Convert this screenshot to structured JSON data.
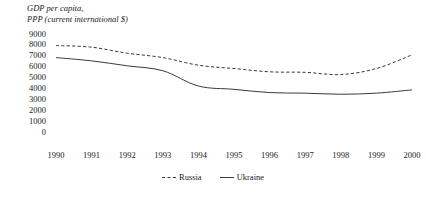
{
  "chart_data": {
    "type": "line",
    "title": "GDP per capita,\nPPP (current international $)",
    "xlabel": "",
    "ylabel": "",
    "ylim": [
      0,
      9000
    ],
    "ytick_step": 1000,
    "yticks": [
      "9000",
      "8000",
      "7000",
      "6000",
      "5000",
      "4000",
      "3000",
      "2000",
      "1000",
      "0"
    ],
    "categories": [
      "1990",
      "1991",
      "1992",
      "1993",
      "1994",
      "1995",
      "1996",
      "1997",
      "1998",
      "1999",
      "2000"
    ],
    "x": [
      1990,
      1991,
      1992,
      1993,
      1994,
      1995,
      1996,
      1997,
      1998,
      1999,
      2000
    ],
    "grid": false,
    "legend_position": "bottom",
    "series": [
      {
        "name": "Russia",
        "style": "dashed",
        "color": "#3a3a3a",
        "values": [
          7900,
          7750,
          7200,
          6800,
          6100,
          5800,
          5500,
          5450,
          5250,
          5800,
          7050
        ]
      },
      {
        "name": "Ukraine",
        "style": "solid",
        "color": "#3a3a3a",
        "values": [
          6800,
          6500,
          6050,
          5600,
          4200,
          3900,
          3600,
          3550,
          3450,
          3550,
          3850
        ]
      }
    ]
  },
  "legend": {
    "items": [
      {
        "label": "Russia",
        "style": "dashed"
      },
      {
        "label": "Ukraine",
        "style": "solid"
      }
    ]
  }
}
